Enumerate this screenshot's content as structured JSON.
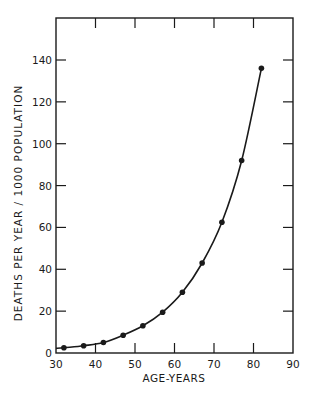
{
  "chart_data": {
    "type": "line",
    "title": "",
    "xlabel": "AGE-YEARS",
    "ylabel": "DEATHS PER YEAR / 1000 POPULATION",
    "xlim": [
      30,
      90
    ],
    "ylim": [
      0,
      160
    ],
    "x_ticks": [
      30,
      40,
      50,
      60,
      70,
      80,
      90
    ],
    "y_ticks": [
      0,
      20,
      40,
      60,
      80,
      100,
      120,
      140
    ],
    "grid": false,
    "legend": null,
    "series": [
      {
        "name": "Death rate",
        "style": "line-with-markers",
        "x": [
          32,
          37,
          42,
          47,
          52,
          57,
          62,
          67,
          72,
          77,
          82
        ],
        "y": [
          2.5,
          3.5,
          5,
          8.5,
          13,
          19.5,
          29,
          43,
          62.5,
          92,
          136
        ]
      }
    ]
  },
  "layout": {
    "plot": {
      "left": 56,
      "right": 293,
      "top": 18,
      "bottom": 353
    },
    "colors": {
      "ink": "#1a1a1a",
      "background": "#ffffff"
    }
  }
}
